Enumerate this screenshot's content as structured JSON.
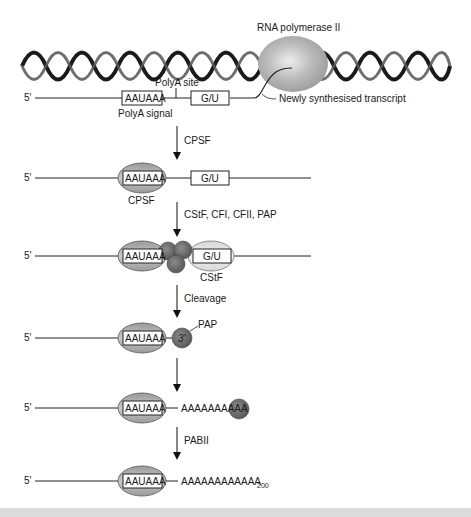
{
  "diagram": {
    "top": {
      "polymerase_label": "RNA polymerase II",
      "polya_site_label": "PolyA site",
      "transcript_label": "Newly synthesised transcript",
      "polya_signal_label": "PolyA signal",
      "five_prime": "5'",
      "signal_box": "AAUAAA",
      "gu_box": "G/U"
    },
    "steps": [
      {
        "arrow_label": "CPSF"
      },
      {
        "arrow_label": "CStF, CFI, CFII, PAP"
      },
      {
        "arrow_label": "Cleavage"
      },
      {
        "arrow_label": ""
      },
      {
        "arrow_label": "PABII"
      }
    ],
    "rows": [
      {
        "five_prime": "5'",
        "signal_box": "AAUAAA",
        "gu_box": "G/U",
        "factor_label": "CPSF"
      },
      {
        "five_prime": "5'",
        "signal_box": "AAUAAA",
        "gu_box": "G/U",
        "factor_label": "CStF"
      },
      {
        "five_prime": "5'",
        "signal_box": "AAUAAA",
        "three_prime": "3'",
        "factor_label": "PAP"
      },
      {
        "five_prime": "5'",
        "signal_box": "AAUAAA",
        "tail": "AAAAAAAAAA"
      },
      {
        "five_prime": "5'",
        "signal_box": "AAUAAA",
        "tail": "AAAAAAAAAAAA",
        "tail_subscript": "200"
      }
    ],
    "colors": {
      "line": "#222222",
      "cpsf_fill": "#a8a8a8",
      "pap_fill": "#6e6e6e",
      "cstf_fill": "#e4e4e4",
      "polymerase_fill": "#b8b8b8",
      "background": "#ffffff",
      "footer_band": "#dcdcdc"
    }
  }
}
